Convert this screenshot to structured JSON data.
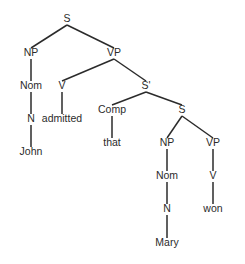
{
  "diagram": {
    "type": "constituency-parse-tree",
    "sentence": "John admitted that Mary won",
    "colors": {
      "background": "#ffffff",
      "ink": "#2b2b2b",
      "edge": "#2b2b2b"
    },
    "nodes": [
      {
        "id": "S_root",
        "label": "S",
        "x": 67,
        "y": 22,
        "kind": "category"
      },
      {
        "id": "NP1",
        "label": "NP",
        "x": 31,
        "y": 56,
        "kind": "category"
      },
      {
        "id": "VP1",
        "label": "VP",
        "x": 114,
        "y": 56,
        "kind": "category"
      },
      {
        "id": "Nom1",
        "label": "Nom",
        "x": 31,
        "y": 89,
        "kind": "category"
      },
      {
        "id": "V1",
        "label": "V",
        "x": 62,
        "y": 89,
        "kind": "category"
      },
      {
        "id": "Sbar",
        "label": "S'",
        "x": 146,
        "y": 89,
        "kind": "category"
      },
      {
        "id": "N1",
        "label": "N",
        "x": 31,
        "y": 122,
        "kind": "category"
      },
      {
        "id": "admitted",
        "label": "admitted",
        "x": 62,
        "y": 122,
        "kind": "terminal"
      },
      {
        "id": "Comp",
        "label": "Comp",
        "x": 112,
        "y": 113,
        "kind": "category"
      },
      {
        "id": "S_inner",
        "label": "S",
        "x": 182,
        "y": 113,
        "kind": "category"
      },
      {
        "id": "John",
        "label": "John",
        "x": 31,
        "y": 155,
        "kind": "terminal"
      },
      {
        "id": "that",
        "label": "that",
        "x": 112,
        "y": 146,
        "kind": "terminal"
      },
      {
        "id": "NP2",
        "label": "NP",
        "x": 167,
        "y": 146,
        "kind": "category"
      },
      {
        "id": "VP2",
        "label": "VP",
        "x": 213,
        "y": 146,
        "kind": "category"
      },
      {
        "id": "Nom2",
        "label": "Nom",
        "x": 167,
        "y": 179,
        "kind": "category"
      },
      {
        "id": "V2",
        "label": "V",
        "x": 213,
        "y": 179,
        "kind": "category"
      },
      {
        "id": "N2",
        "label": "N",
        "x": 167,
        "y": 212,
        "kind": "category"
      },
      {
        "id": "won",
        "label": "won",
        "x": 213,
        "y": 212,
        "kind": "terminal"
      },
      {
        "id": "Mary",
        "label": "Mary",
        "x": 167,
        "y": 246,
        "kind": "terminal"
      }
    ],
    "edges": [
      {
        "from": "S_root",
        "to": "NP1"
      },
      {
        "from": "S_root",
        "to": "VP1"
      },
      {
        "from": "NP1",
        "to": "Nom1"
      },
      {
        "from": "Nom1",
        "to": "N1"
      },
      {
        "from": "N1",
        "to": "John"
      },
      {
        "from": "VP1",
        "to": "V1"
      },
      {
        "from": "VP1",
        "to": "Sbar"
      },
      {
        "from": "V1",
        "to": "admitted"
      },
      {
        "from": "Sbar",
        "to": "Comp"
      },
      {
        "from": "Sbar",
        "to": "S_inner"
      },
      {
        "from": "Comp",
        "to": "that"
      },
      {
        "from": "S_inner",
        "to": "NP2"
      },
      {
        "from": "S_inner",
        "to": "VP2"
      },
      {
        "from": "NP2",
        "to": "Nom2"
      },
      {
        "from": "Nom2",
        "to": "N2"
      },
      {
        "from": "N2",
        "to": "Mary"
      },
      {
        "from": "VP2",
        "to": "V2"
      },
      {
        "from": "V2",
        "to": "won"
      }
    ]
  }
}
